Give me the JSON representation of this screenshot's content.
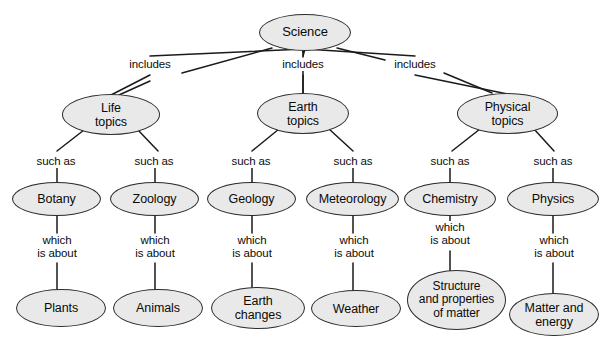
{
  "diagram": {
    "type": "concept-map",
    "style": {
      "node_fill": "#e9e9e9",
      "node_stroke": "#2b2b2b",
      "edge_color": "#1a1a1a",
      "text_color": "#0b0b0b",
      "background": "#ffffff"
    },
    "nodes": [
      {
        "id": "science",
        "label": "Science",
        "x": 259,
        "y": 14,
        "w": 92,
        "h": 37,
        "font": 13
      },
      {
        "id": "life",
        "label": "Life\ntopics",
        "x": 62,
        "y": 94,
        "w": 98,
        "h": 41,
        "font": 12.5
      },
      {
        "id": "earth",
        "label": "Earth\ntopics",
        "x": 257,
        "y": 93,
        "w": 92,
        "h": 41,
        "font": 12.5
      },
      {
        "id": "physical",
        "label": "Physical\ntopics",
        "x": 457,
        "y": 93,
        "w": 101,
        "h": 41,
        "font": 12.5
      },
      {
        "id": "botany",
        "label": "Botany",
        "x": 12,
        "y": 182,
        "w": 89,
        "h": 34,
        "font": 12.5
      },
      {
        "id": "zoology",
        "label": "Zoology",
        "x": 110,
        "y": 182,
        "w": 89,
        "h": 34,
        "font": 12.5
      },
      {
        "id": "geology",
        "label": "Geology",
        "x": 207,
        "y": 182,
        "w": 89,
        "h": 34,
        "font": 12.5
      },
      {
        "id": "meteorology",
        "label": "Meteorology",
        "x": 306,
        "y": 182,
        "w": 93,
        "h": 34,
        "font": 12.5
      },
      {
        "id": "chemistry",
        "label": "Chemistry",
        "x": 404,
        "y": 182,
        "w": 92,
        "h": 34,
        "font": 12.5
      },
      {
        "id": "physics",
        "label": "Physics",
        "x": 507,
        "y": 182,
        "w": 92,
        "h": 34,
        "font": 12.5
      },
      {
        "id": "plants",
        "label": "Plants",
        "x": 16,
        "y": 289,
        "w": 90,
        "h": 38,
        "font": 12.5
      },
      {
        "id": "animals",
        "label": "Animals",
        "x": 113,
        "y": 289,
        "w": 90,
        "h": 38,
        "font": 12.5
      },
      {
        "id": "earthchg",
        "label": "Earth\nchanges",
        "x": 211,
        "y": 287,
        "w": 94,
        "h": 42,
        "font": 12.5
      },
      {
        "id": "weather",
        "label": "Weather",
        "x": 311,
        "y": 290,
        "w": 90,
        "h": 37,
        "font": 12.5
      },
      {
        "id": "structure",
        "label": "Structure\nand properties\nof matter",
        "x": 407,
        "y": 270,
        "w": 99,
        "h": 60,
        "font": 12
      },
      {
        "id": "matter",
        "label": "Matter and\nenergy",
        "x": 509,
        "y": 293,
        "w": 90,
        "h": 43,
        "font": 12.5
      }
    ],
    "edge_labels": [
      {
        "id": "inc-life",
        "text": "includes",
        "x": 121,
        "y": 58,
        "w": 58,
        "font": 11.5
      },
      {
        "id": "inc-earth",
        "text": "includes",
        "x": 274,
        "y": 58,
        "w": 58,
        "font": 11.5
      },
      {
        "id": "inc-phys",
        "text": "includes",
        "x": 386,
        "y": 58,
        "w": 58,
        "font": 11.5
      },
      {
        "id": "sa-botany",
        "text": "such as",
        "x": 30,
        "y": 155,
        "w": 52,
        "font": 11.5
      },
      {
        "id": "sa-zoology",
        "text": "such as",
        "x": 128,
        "y": 155,
        "w": 52,
        "font": 11.5
      },
      {
        "id": "sa-geology",
        "text": "such as",
        "x": 225,
        "y": 155,
        "w": 52,
        "font": 11.5
      },
      {
        "id": "sa-meteor",
        "text": "such as",
        "x": 327,
        "y": 155,
        "w": 52,
        "font": 11.5
      },
      {
        "id": "sa-chem",
        "text": "such as",
        "x": 424,
        "y": 155,
        "w": 52,
        "font": 11.5
      },
      {
        "id": "sa-phys",
        "text": "such as",
        "x": 527,
        "y": 155,
        "w": 52,
        "font": 11.5
      },
      {
        "id": "wa-plants",
        "text": "which\nis about",
        "x": 31,
        "y": 234,
        "w": 52,
        "font": 11.5
      },
      {
        "id": "wa-animals",
        "text": "which\nis about",
        "x": 129,
        "y": 234,
        "w": 52,
        "font": 11.5
      },
      {
        "id": "wa-earth",
        "text": "which\nis about",
        "x": 226,
        "y": 234,
        "w": 52,
        "font": 11.5
      },
      {
        "id": "wa-weather",
        "text": "which\nis about",
        "x": 328,
        "y": 234,
        "w": 52,
        "font": 11.5
      },
      {
        "id": "wa-struct",
        "text": "which\nis about",
        "x": 424,
        "y": 221,
        "w": 52,
        "font": 11.5
      },
      {
        "id": "wa-matter",
        "text": "which\nis about",
        "x": 528,
        "y": 234,
        "w": 52,
        "font": 11.5
      }
    ],
    "edges": [
      {
        "id": "e-sci-life",
        "from": "science",
        "to": "life",
        "relation": "includes"
      },
      {
        "id": "e-sci-earth",
        "from": "science",
        "to": "earth",
        "relation": "includes"
      },
      {
        "id": "e-sci-phys",
        "from": "science",
        "to": "physical",
        "relation": "includes"
      },
      {
        "id": "e-life-bot",
        "from": "life",
        "to": "botany",
        "relation": "such as"
      },
      {
        "id": "e-life-zoo",
        "from": "life",
        "to": "zoology",
        "relation": "such as"
      },
      {
        "id": "e-earth-geo",
        "from": "earth",
        "to": "geology",
        "relation": "such as"
      },
      {
        "id": "e-earth-met",
        "from": "earth",
        "to": "meteorology",
        "relation": "such as"
      },
      {
        "id": "e-phys-chem",
        "from": "physical",
        "to": "chemistry",
        "relation": "such as"
      },
      {
        "id": "e-phys-phy",
        "from": "physical",
        "to": "physics",
        "relation": "such as"
      },
      {
        "id": "e-bot-pla",
        "from": "botany",
        "to": "plants",
        "relation": "which is about"
      },
      {
        "id": "e-zoo-ani",
        "from": "zoology",
        "to": "animals",
        "relation": "which is about"
      },
      {
        "id": "e-geo-ech",
        "from": "geology",
        "to": "earthchg",
        "relation": "which is about"
      },
      {
        "id": "e-met-wea",
        "from": "meteorology",
        "to": "weather",
        "relation": "which is about"
      },
      {
        "id": "e-chem-str",
        "from": "chemistry",
        "to": "structure",
        "relation": "which is about"
      },
      {
        "id": "e-phy-mat",
        "from": "physics",
        "to": "matter",
        "relation": "which is about"
      }
    ],
    "lines": [
      {
        "id": "l-sci-life-a",
        "x1": 272,
        "y1": 48,
        "x2": 182,
        "y2": 73
      },
      {
        "id": "l-sci-life-b",
        "x1": 150,
        "y1": 81,
        "x2": 119,
        "y2": 95
      },
      {
        "id": "l-sci-earth-a",
        "x1": 303,
        "y1": 51,
        "x2": 303,
        "y2": 52
      },
      {
        "id": "l-sci-earth-b",
        "x1": 303,
        "y1": 52,
        "x2": 303,
        "y2": 52
      },
      {
        "id": "l-sci-phys-a",
        "x1": 337,
        "y1": 48,
        "x2": 385,
        "y2": 60
      },
      {
        "id": "l-sci-phys-b",
        "x1": 444,
        "y1": 73,
        "x2": 492,
        "y2": 93
      },
      {
        "id": "l-life-bot",
        "x1": 84,
        "y1": 130,
        "x2": 57,
        "y2": 151
      },
      {
        "id": "l-life-zoo",
        "x1": 138,
        "y1": 130,
        "x2": 158,
        "y2": 151
      },
      {
        "id": "l-earth-geo",
        "x1": 279,
        "y1": 129,
        "x2": 252,
        "y2": 151
      },
      {
        "id": "l-earth-met",
        "x1": 329,
        "y1": 129,
        "x2": 353,
        "y2": 151
      },
      {
        "id": "l-phys-chem",
        "x1": 480,
        "y1": 129,
        "x2": 452,
        "y2": 151
      },
      {
        "id": "l-phys-phy",
        "x1": 534,
        "y1": 129,
        "x2": 554,
        "y2": 151
      }
    ],
    "verticals": [
      {
        "id": "v-sci-earth",
        "x": 303,
        "y1": 51,
        "y2": 57
      },
      {
        "id": "v-earth-mid",
        "x": 303,
        "y1": 71,
        "y2": 93
      },
      {
        "id": "v-bot-top",
        "x": 57,
        "y1": 168,
        "y2": 183
      },
      {
        "id": "v-zoo-top",
        "x": 155,
        "y1": 168,
        "y2": 183
      },
      {
        "id": "v-geo-top",
        "x": 252,
        "y1": 168,
        "y2": 183
      },
      {
        "id": "v-met-top",
        "x": 353,
        "y1": 168,
        "y2": 183
      },
      {
        "id": "v-chem-top",
        "x": 450,
        "y1": 168,
        "y2": 183
      },
      {
        "id": "v-phy-top",
        "x": 553,
        "y1": 168,
        "y2": 183
      },
      {
        "id": "v-bot-bot",
        "x": 57,
        "y1": 216,
        "y2": 233
      },
      {
        "id": "v-zoo-bot",
        "x": 155,
        "y1": 216,
        "y2": 233
      },
      {
        "id": "v-geo-bot",
        "x": 252,
        "y1": 216,
        "y2": 233
      },
      {
        "id": "v-met-bot",
        "x": 353,
        "y1": 216,
        "y2": 233
      },
      {
        "id": "v-chem-bot",
        "x": 450,
        "y1": 216,
        "y2": 221
      },
      {
        "id": "v-phy-bot",
        "x": 553,
        "y1": 216,
        "y2": 233
      },
      {
        "id": "v-pla-top",
        "x": 57,
        "y1": 263,
        "y2": 292
      },
      {
        "id": "v-ani-top",
        "x": 155,
        "y1": 263,
        "y2": 292
      },
      {
        "id": "v-ech-top",
        "x": 252,
        "y1": 263,
        "y2": 290
      },
      {
        "id": "v-wea-top",
        "x": 353,
        "y1": 263,
        "y2": 293
      },
      {
        "id": "v-str-top",
        "x": 450,
        "y1": 251,
        "y2": 272
      },
      {
        "id": "v-mat-top",
        "x": 553,
        "y1": 263,
        "y2": 296
      }
    ]
  }
}
